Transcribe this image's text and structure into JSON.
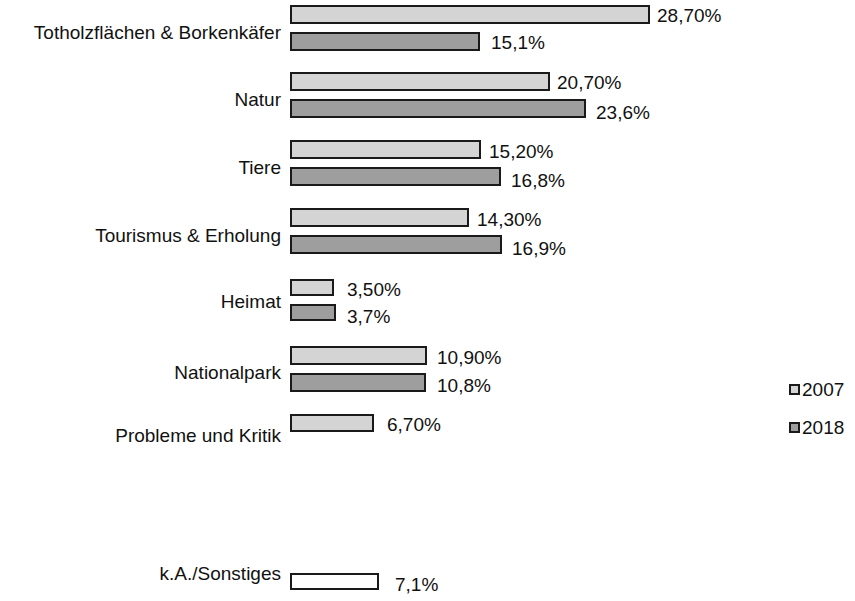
{
  "chart_data": {
    "type": "bar",
    "orientation": "horizontal",
    "title": "",
    "subtitle": "",
    "xlabel": "",
    "ylabel": "",
    "grid": false,
    "legend_position": "right",
    "xlim": [
      0,
      28.7
    ],
    "unit": "%",
    "decimal_separator": ",",
    "categories": [
      "Totholzflächen & Borkenkäfer",
      "Natur",
      "Tiere",
      "Tourismus & Erholung",
      "Heimat",
      "Nationalpark",
      "Probleme und Kritik",
      "k.A./Sonstiges"
    ],
    "series": [
      {
        "name": "2007",
        "color": "#d4d4d4",
        "values": [
          28.7,
          20.7,
          15.2,
          14.3,
          3.5,
          10.9,
          6.7,
          null
        ],
        "labels": [
          "28,70%",
          "20,70%",
          "15,20%",
          "14,30%",
          "3,50%",
          "10,90%",
          "6,70%",
          null
        ]
      },
      {
        "name": "2018",
        "color": "#9e9e9e",
        "values": [
          15.1,
          23.6,
          16.8,
          16.9,
          3.7,
          10.8,
          null,
          7.1
        ],
        "labels": [
          "15,1%",
          "23,6%",
          "16,8%",
          "16,9%",
          "3,7%",
          "10,8%",
          null,
          "7,1%"
        ]
      }
    ]
  },
  "legend": {
    "items": [
      {
        "label": "2007",
        "color": "#d4d4d4"
      },
      {
        "label": "2018",
        "color": "#9e9e9e"
      }
    ]
  },
  "bars": [
    {
      "category_index": 0,
      "series": "2007",
      "label": "28,70%",
      "value": 28.7
    },
    {
      "category_index": 0,
      "series": "2018",
      "label": "15,1%",
      "value": 15.1
    },
    {
      "category_index": 1,
      "series": "2007",
      "label": "20,70%",
      "value": 20.7
    },
    {
      "category_index": 1,
      "series": "2018",
      "label": "23,6%",
      "value": 23.6
    },
    {
      "category_index": 2,
      "series": "2007",
      "label": "15,20%",
      "value": 15.2
    },
    {
      "category_index": 2,
      "series": "2018",
      "label": "16,8%",
      "value": 16.8
    },
    {
      "category_index": 3,
      "series": "2007",
      "label": "14,30%",
      "value": 14.3
    },
    {
      "category_index": 3,
      "series": "2018",
      "label": "16,9%",
      "value": 16.9
    },
    {
      "category_index": 4,
      "series": "2007",
      "label": "3,50%",
      "value": 3.5
    },
    {
      "category_index": 4,
      "series": "2018",
      "label": "3,7%",
      "value": 3.7
    },
    {
      "category_index": 5,
      "series": "2007",
      "label": "10,90%",
      "value": 10.9
    },
    {
      "category_index": 5,
      "series": "2018",
      "label": "10,8%",
      "value": 10.8
    },
    {
      "category_index": 6,
      "series": "2007",
      "label": "6,70%",
      "value": 6.7
    },
    {
      "category_index": 7,
      "series": "none",
      "label": "7,1%",
      "value": 7.1
    }
  ],
  "layout": {
    "bar_origin_x": 290,
    "px_per_percent": 12.55,
    "bar_height": 19,
    "rows": [
      {
        "bar_top": 5,
        "label_top": 22
      },
      {
        "bar_top": 32,
        "label_top": 22
      },
      {
        "bar_top": 72,
        "label_top": 89
      },
      {
        "bar_top": 99,
        "label_top": 89
      },
      {
        "bar_top": 140,
        "label_top": 157
      },
      {
        "bar_top": 167,
        "label_top": 157
      },
      {
        "bar_top": 208,
        "label_top": 225
      },
      {
        "bar_top": 235,
        "label_top": 225
      },
      {
        "bar_top": 279,
        "label_top": 291
      },
      {
        "bar_top": 304,
        "label_top": 291
      },
      {
        "bar_top": 346,
        "label_top": 362
      },
      {
        "bar_top": 373,
        "label_top": 362
      },
      {
        "bar_top": 414,
        "label_top": 425
      },
      {
        "bar_top": 573,
        "label_top": 563
      }
    ]
  }
}
